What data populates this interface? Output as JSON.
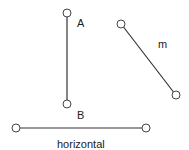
{
  "diagram": {
    "stroke_color": "#333333",
    "segments": [
      {
        "id": "AB",
        "label": "",
        "endpoints": [
          {
            "name": "A",
            "x": 67,
            "y": 13
          },
          {
            "name": "B",
            "x": 67,
            "y": 104
          }
        ],
        "orientation": "vertical"
      },
      {
        "id": "m",
        "label": "m",
        "endpoints": [
          {
            "name": "",
            "x": 121,
            "y": 24
          },
          {
            "name": "",
            "x": 176,
            "y": 95
          }
        ],
        "orientation": "diagonal"
      },
      {
        "id": "horizontal",
        "label": "horizontal",
        "endpoints": [
          {
            "name": "",
            "x": 16,
            "y": 128
          },
          {
            "name": "",
            "x": 146,
            "y": 128
          }
        ],
        "orientation": "horizontal"
      }
    ],
    "labels": {
      "point_a": "A",
      "point_b": "B",
      "line_m": "m",
      "line_horizontal": "horizontal"
    }
  }
}
